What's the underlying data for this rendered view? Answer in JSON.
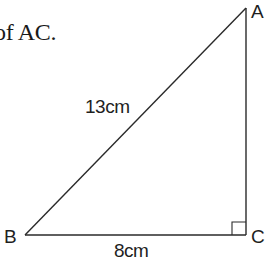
{
  "caption": {
    "text": "of AC."
  },
  "triangle": {
    "vertices": {
      "A": {
        "label": "A"
      },
      "B": {
        "label": "B"
      },
      "C": {
        "label": "C"
      }
    },
    "sides": {
      "AB": {
        "label": "13cm"
      },
      "BC": {
        "label": "8cm"
      }
    },
    "right_angle_at": "C",
    "stroke_color": "#2a2a2a"
  }
}
